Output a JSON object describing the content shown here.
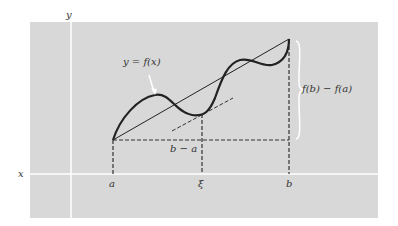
{
  "diagram": {
    "labels": {
      "y_axis": "y",
      "x_axis": "x",
      "curve": "y = f(x)",
      "point_a": "a",
      "point_xi": "ξ",
      "point_b": "b",
      "run": "b − a",
      "rise": "f(b) − f(a)"
    },
    "colors": {
      "background": "#d8d8d8",
      "axes": "#ffffff",
      "curve": "#222222",
      "dashed": "#333333",
      "text": "#333333"
    }
  }
}
